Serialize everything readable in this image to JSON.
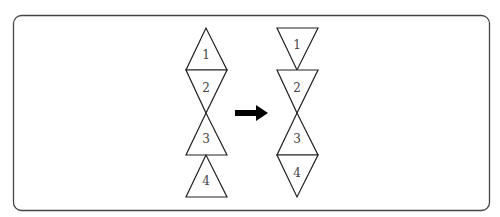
{
  "diagram": {
    "frame": {
      "stroke": "#444444"
    },
    "left_figure": {
      "triangles": [
        {
          "label": "1",
          "orientation": "up"
        },
        {
          "label": "2",
          "orientation": "down"
        },
        {
          "label": "3",
          "orientation": "up"
        },
        {
          "label": "4",
          "orientation": "up"
        }
      ]
    },
    "arrow": {
      "direction": "right",
      "color": "#000000"
    },
    "right_figure": {
      "triangles": [
        {
          "label": "1",
          "orientation": "down"
        },
        {
          "label": "2",
          "orientation": "down"
        },
        {
          "label": "3",
          "orientation": "up"
        },
        {
          "label": "4",
          "orientation": "down"
        }
      ]
    }
  }
}
